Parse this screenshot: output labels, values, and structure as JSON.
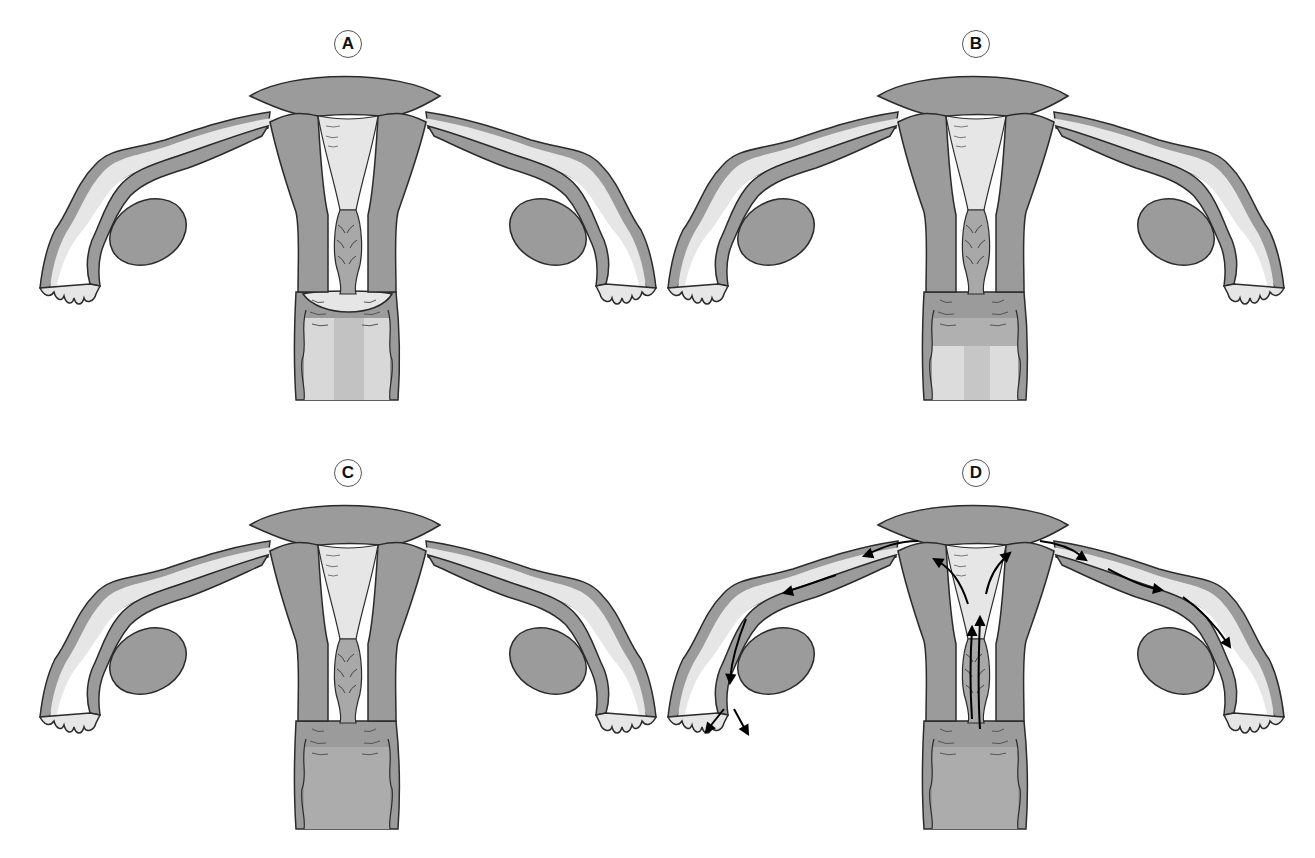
{
  "figure": {
    "colors": {
      "tissue": "#9b9b9b",
      "lumen": "#e6e6e6",
      "outline": "#2b2b2b",
      "arrow": "#000000",
      "background": "#ffffff"
    },
    "panels": [
      {
        "id": "A",
        "label": "A",
        "x": 0,
        "y": 0,
        "vagina_state": "open-light",
        "arrows": false,
        "cervix": "domed"
      },
      {
        "id": "B",
        "label": "B",
        "x": 628,
        "y": 0,
        "vagina_state": "half-light",
        "arrows": false,
        "cervix": "folded"
      },
      {
        "id": "C",
        "label": "C",
        "x": 0,
        "y": 429,
        "vagina_state": "closed",
        "arrows": false,
        "cervix": "folded"
      },
      {
        "id": "D",
        "label": "D",
        "x": 628,
        "y": 429,
        "vagina_state": "closed",
        "arrows": true,
        "cervix": "folded"
      }
    ],
    "structures": [
      "uterus",
      "fallopian-tube-left",
      "fallopian-tube-right",
      "ovary-left",
      "ovary-right",
      "cervical-canal",
      "vagina",
      "fimbriae"
    ],
    "arrows_description": "Panel D: arrows show upward transport through cervical canal and uterine cavity, then outward along both fallopian tubes to the fimbriae"
  }
}
